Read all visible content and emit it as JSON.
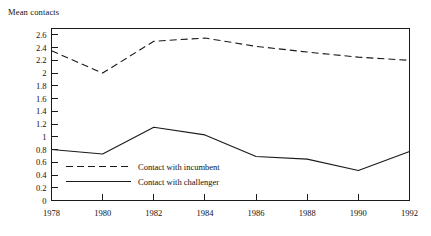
{
  "chart_title": "Mean contacts",
  "chart_data": {
    "type": "line",
    "title": "Mean contacts",
    "xlabel": "",
    "ylabel": "Mean contacts",
    "x": [
      1978,
      1980,
      1982,
      1984,
      1986,
      1988,
      1990,
      1992
    ],
    "xlim": [
      1978,
      1992
    ],
    "ylim": [
      0,
      2.7
    ],
    "grid": false,
    "legend_position": "inside-lower-left",
    "xticks": [
      1978,
      1980,
      1982,
      1984,
      1986,
      1988,
      1990,
      1992
    ],
    "xtick_labels": [
      "1978",
      "1980",
      "1982",
      "1984",
      "1986",
      "1988",
      "1990",
      "1992"
    ],
    "yticks": [
      0,
      0.2,
      0.4,
      0.6,
      0.8,
      1.0,
      1.2,
      1.4,
      1.6,
      1.8,
      2.0,
      2.2,
      2.4,
      2.6
    ],
    "ytick_labels": [
      "0",
      "0.2",
      "0.4",
      "0.6",
      "0.8",
      "1",
      "1.2",
      "1.4",
      "1.6",
      "1.8",
      "2",
      "2.2",
      "2.4",
      "2.6"
    ],
    "series": [
      {
        "name": "Contact with incumbent",
        "style": "dashed",
        "color": "#1a1a1a",
        "values": [
          2.35,
          2.0,
          2.5,
          2.55,
          2.42,
          2.33,
          2.25,
          2.2
        ]
      },
      {
        "name": "Contact with challenger",
        "style": "solid",
        "color": "#1a1a1a",
        "values": [
          0.8,
          0.73,
          1.15,
          1.03,
          0.69,
          0.65,
          0.47,
          0.77
        ]
      }
    ]
  },
  "legend": {
    "entries": [
      {
        "label": "Contact with incumbent",
        "style": "dashed"
      },
      {
        "label": "Contact with challenger",
        "style": "solid"
      }
    ]
  }
}
